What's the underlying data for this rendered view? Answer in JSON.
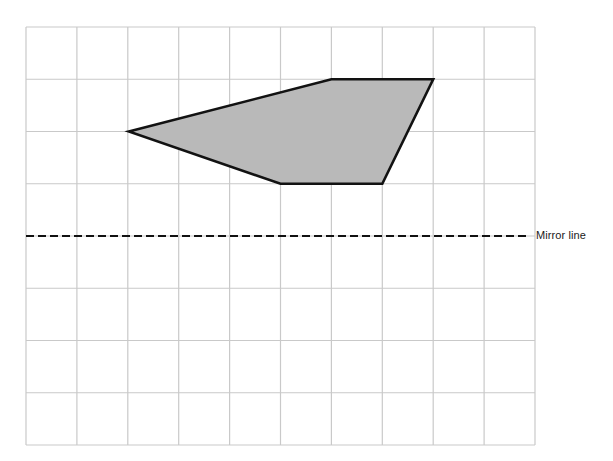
{
  "figure": {
    "type": "reflection-worksheet",
    "title": "",
    "canvas": {
      "width": 613,
      "height": 461,
      "background": "#ffffff"
    },
    "grid": {
      "origin_x": 26,
      "origin_y": 27,
      "cell_width": 50.9,
      "cell_height": 52.25,
      "columns": 10,
      "rows": 8,
      "line_color": "#c9c9c9",
      "line_width": 1.2
    },
    "shape": {
      "name": "shaded-pentagon",
      "fill_color": "#b9b9b9",
      "stroke_color": "#121212",
      "stroke_width": 2.6,
      "vertices_grid": [
        [
          2,
          2
        ],
        [
          6,
          1
        ],
        [
          8,
          1
        ],
        [
          7,
          3
        ],
        [
          5,
          3
        ]
      ],
      "vertices_px": [
        [
          128.8,
          131.5
        ],
        [
          331.4,
          79.3
        ],
        [
          433.2,
          79.3
        ],
        [
          382.3,
          183.8
        ],
        [
          280.5,
          183.8
        ]
      ],
      "points_attr": "128.8,131.5 331.4,79.3 433.2,79.3 382.3,183.8 280.5,183.8"
    },
    "mirror_line": {
      "label": "Mirror line",
      "orientation": "horizontal",
      "y_px": 236,
      "grid_row": 4,
      "x_start": 26,
      "x_end": 528,
      "color": "#111111",
      "stroke_width": 2.2,
      "dash_pattern": "8,4",
      "label_x": 536,
      "label_y": 236
    }
  }
}
